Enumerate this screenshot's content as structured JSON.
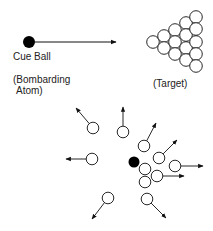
{
  "labels": {
    "cue_ball": "Cue Ball",
    "bombarding_line1": "(Bombarding",
    "bombarding_line2": "Atom)",
    "target": "(Target)"
  },
  "colors": {
    "ink": "#111111",
    "ball_fill": "#ffffff",
    "cue_fill": "#000000"
  },
  "before": {
    "cue_ball": {
      "cx": 29,
      "cy": 42,
      "r": 6
    },
    "arrow": {
      "x1": 35,
      "y1": 42,
      "x2": 116,
      "y2": 42
    },
    "rack": {
      "r": 6.3,
      "balls": [
        [
          153,
          42
        ],
        [
          164,
          36
        ],
        [
          164,
          48
        ],
        [
          175,
          30
        ],
        [
          175,
          42
        ],
        [
          175,
          54
        ],
        [
          186,
          23
        ],
        [
          186,
          35
        ],
        [
          186,
          48
        ],
        [
          186,
          60
        ],
        [
          196,
          17
        ],
        [
          196,
          29
        ],
        [
          196,
          42
        ],
        [
          196,
          54
        ],
        [
          196,
          66
        ]
      ]
    }
  },
  "after": {
    "cue_ball": {
      "cx": 134,
      "cy": 162,
      "r": 5.5
    },
    "ball_r": 5.8,
    "balls": [
      {
        "cx": 93,
        "cy": 128,
        "ax": 76,
        "ay": 108
      },
      {
        "cx": 123,
        "cy": 132,
        "ax": 123,
        "ay": 107
      },
      {
        "cx": 144,
        "cy": 146,
        "ax": 156,
        "ay": 123
      },
      {
        "cx": 159,
        "cy": 158,
        "ax": 177,
        "ay": 140
      },
      {
        "cx": 92,
        "cy": 159,
        "ax": 66,
        "ay": 159
      },
      {
        "cx": 145,
        "cy": 169
      },
      {
        "cx": 175,
        "cy": 166,
        "ax": 203,
        "ay": 166
      },
      {
        "cx": 157,
        "cy": 176,
        "ax": 184,
        "ay": 176
      },
      {
        "cx": 145,
        "cy": 182
      },
      {
        "cx": 108,
        "cy": 198,
        "ax": 92,
        "ay": 219
      },
      {
        "cx": 147,
        "cy": 199,
        "ax": 166,
        "ay": 218
      }
    ]
  }
}
